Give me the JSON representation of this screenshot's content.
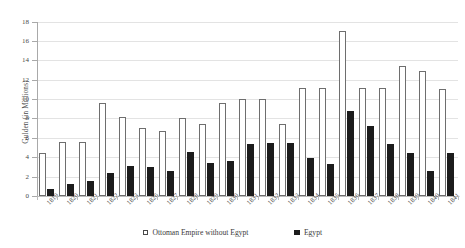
{
  "chart_data": {
    "type": "bar",
    "title": "",
    "xlabel": "",
    "ylabel": "Gulden (in Millions)",
    "ylim": [
      0,
      18
    ],
    "ytick_step": 2,
    "yticks": [
      0,
      2,
      4,
      6,
      8,
      10,
      12,
      14,
      16,
      18
    ],
    "grid": true,
    "legend_position": "bottom-center",
    "categories": [
      "1819",
      "1820",
      "1821",
      "1822",
      "1823",
      "1826",
      "1827",
      "1828",
      "1829",
      "1830",
      "1831",
      "1832",
      "1833",
      "1834",
      "1835",
      "1836",
      "1837",
      "1838",
      "1839",
      "1840",
      "1841"
    ],
    "series": [
      {
        "name": "Ottoman Empire without Egypt",
        "color": "#ffffff",
        "edge_color": "#6e6e6e",
        "values": [
          4.4,
          5.6,
          5.6,
          9.6,
          8.2,
          7.0,
          6.7,
          8.0,
          7.4,
          9.6,
          10.0,
          10.0,
          7.4,
          11.1,
          11.1,
          17.0,
          11.1,
          11.1,
          13.4,
          12.9,
          11.0
        ]
      },
      {
        "name": "Egypt",
        "color": "#1c1c1c",
        "edge_color": "#1c1c1c",
        "values": [
          0.7,
          1.2,
          1.6,
          2.4,
          3.1,
          3.0,
          2.6,
          4.5,
          3.4,
          3.6,
          5.4,
          5.5,
          5.5,
          3.9,
          3.3,
          8.8,
          7.2,
          5.4,
          4.4,
          2.6,
          4.4
        ]
      }
    ]
  },
  "legend": {
    "entries": [
      {
        "label": "Ottoman Empire without Egypt",
        "swatch": "open"
      },
      {
        "label": "Egypt",
        "swatch": "filled"
      }
    ]
  }
}
